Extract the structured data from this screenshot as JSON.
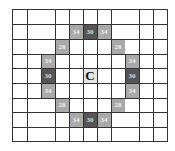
{
  "grid": {
    "columns": 11,
    "rows": 9,
    "colors": {
      "light": "#a9a9a9",
      "dark": "#555555",
      "center": "#e4e4e4",
      "line": "#333333"
    },
    "center_label": "C",
    "cells": [
      {
        "row": 1,
        "col": 4,
        "value": "34",
        "shade": "light"
      },
      {
        "row": 1,
        "col": 5,
        "value": "30",
        "shade": "dark"
      },
      {
        "row": 1,
        "col": 6,
        "value": "34",
        "shade": "light"
      },
      {
        "row": 2,
        "col": 3,
        "value": "28",
        "shade": "light"
      },
      {
        "row": 2,
        "col": 7,
        "value": "28",
        "shade": "light"
      },
      {
        "row": 3,
        "col": 2,
        "value": "34",
        "shade": "light"
      },
      {
        "row": 3,
        "col": 8,
        "value": "34",
        "shade": "light"
      },
      {
        "row": 4,
        "col": 2,
        "value": "30",
        "shade": "dark"
      },
      {
        "row": 4,
        "col": 5,
        "value": "C",
        "shade": "center"
      },
      {
        "row": 4,
        "col": 8,
        "value": "30",
        "shade": "dark"
      },
      {
        "row": 5,
        "col": 2,
        "value": "34",
        "shade": "light"
      },
      {
        "row": 5,
        "col": 8,
        "value": "34",
        "shade": "light"
      },
      {
        "row": 6,
        "col": 3,
        "value": "28",
        "shade": "light"
      },
      {
        "row": 6,
        "col": 7,
        "value": "28",
        "shade": "light"
      },
      {
        "row": 7,
        "col": 4,
        "value": "34",
        "shade": "light"
      },
      {
        "row": 7,
        "col": 5,
        "value": "30",
        "shade": "dark"
      },
      {
        "row": 7,
        "col": 6,
        "value": "34",
        "shade": "light"
      }
    ]
  }
}
